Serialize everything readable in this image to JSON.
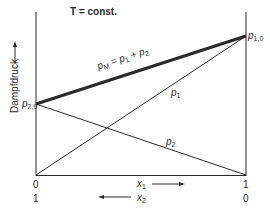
{
  "title": "T = const.",
  "y_axis": {
    "label": "Dampfdruck",
    "arrow": "up-arrow"
  },
  "x_axis": {
    "x1_label": "x",
    "x1_sub": "1",
    "x2_label": "x",
    "x2_sub": "2",
    "x1_ticks": {
      "left": "0",
      "right": "1"
    },
    "x2_ticks": {
      "left": "1",
      "right": "0"
    },
    "x1_arrow": "right-arrow",
    "x2_arrow": "left-arrow"
  },
  "points": {
    "p10": {
      "main": "p",
      "sub": "1,0"
    },
    "p20": {
      "main": "p",
      "sub": "2,0"
    }
  },
  "lines": {
    "pM": {
      "main": "p",
      "sub": "M",
      "eq": " = p",
      "sub1": "1",
      "plus": " + p",
      "sub2": "2"
    },
    "p1": {
      "main": "p",
      "sub": "1"
    },
    "p2": {
      "main": "p",
      "sub": "2"
    }
  },
  "colors": {
    "line": "#2a2a2a",
    "background": "#ffffff"
  }
}
